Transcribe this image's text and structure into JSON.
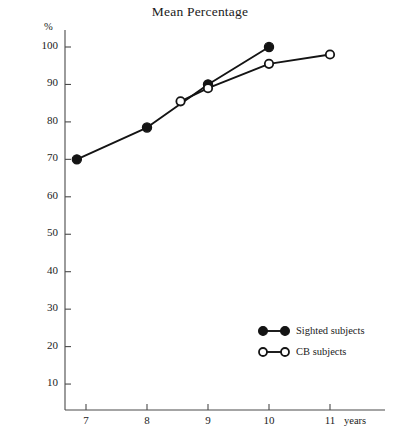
{
  "chart_data": {
    "type": "line",
    "title": "Mean Percentage",
    "xlabel": "years",
    "ylabel": "%",
    "xlim": [
      6.5,
      11.6
    ],
    "ylim": [
      0,
      104
    ],
    "grid": false,
    "legend_position": "lower-right",
    "x_ticks": [
      7,
      8,
      9,
      10,
      11
    ],
    "x_tick_labels": [
      "7",
      "8",
      "9",
      "10",
      "11"
    ],
    "y_ticks": [
      10,
      20,
      30,
      40,
      50,
      60,
      70,
      80,
      90,
      100
    ],
    "y_tick_labels": [
      "10",
      "20",
      "30",
      "40",
      "50",
      "60",
      "70",
      "80",
      "90",
      "100"
    ],
    "series": [
      {
        "name": "Sighted subjects",
        "marker": "filled-circle",
        "color": "#141414",
        "points": [
          {
            "x": 6.85,
            "y": 70
          },
          {
            "x": 8.0,
            "y": 78.5
          },
          {
            "x": 9.0,
            "y": 90
          },
          {
            "x": 10.0,
            "y": 100
          }
        ]
      },
      {
        "name": "CB subjects",
        "marker": "open-circle",
        "color": "#141414",
        "points": [
          {
            "x": 8.55,
            "y": 85.5
          },
          {
            "x": 9.0,
            "y": 89
          },
          {
            "x": 10.0,
            "y": 95.5
          },
          {
            "x": 11.0,
            "y": 98
          }
        ]
      }
    ]
  },
  "legend": {
    "items": [
      {
        "label": "Sighted subjects",
        "marker": "filled-circle"
      },
      {
        "label": "CB subjects",
        "marker": "open-circle"
      }
    ]
  },
  "axes": {
    "y_unit_label": "%",
    "x_unit_label": "years"
  }
}
